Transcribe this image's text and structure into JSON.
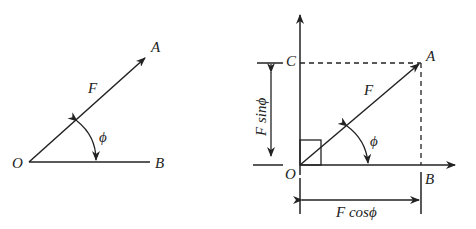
{
  "left_diagram": {
    "labels": {
      "O": "O",
      "A": "A",
      "B": "B",
      "F": "F",
      "phi": "ϕ"
    }
  },
  "right_diagram": {
    "labels": {
      "O": "O",
      "A": "A",
      "B": "B",
      "C": "C",
      "F": "F",
      "phi": "ϕ",
      "vertical_component": "F sinϕ",
      "horizontal_component": "F cosϕ"
    }
  },
  "colors": {
    "stroke": "#222222",
    "background": "#ffffff"
  }
}
